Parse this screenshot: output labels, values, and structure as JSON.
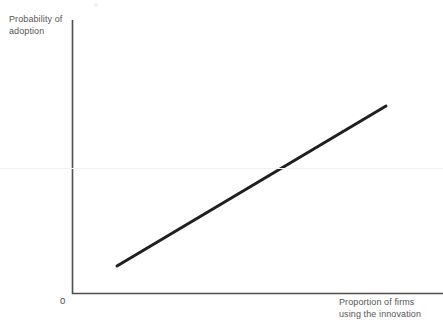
{
  "figure": {
    "background_color": "#ffffff",
    "axis_color": "#4d4d4d",
    "line_color": "#1f1f1f",
    "label_color": "#575757",
    "origin_label": "0",
    "y_axis_label": "Probability of\nadoption",
    "x_axis_label": "Proportion of firms\nusing the innovation"
  },
  "chart_data": {
    "type": "line",
    "title": "",
    "subtitle": "",
    "xlabel": "Proportion of firms using the innovation",
    "ylabel": "Probability of adoption",
    "xlim": [
      0,
      1
    ],
    "ylim": [
      0,
      1
    ],
    "grid": false,
    "legend": "none",
    "axis_ticks": {
      "x": [
        "0"
      ],
      "y": []
    },
    "annotations": [
      {
        "text": "0",
        "x": 0,
        "y": 0,
        "note": "origin tick label at axis corner"
      }
    ],
    "series": [
      {
        "name": "Probability of adoption",
        "style": "solid",
        "width_px": 3,
        "color": "#1f1f1f",
        "x": [
          0.145,
          0.31,
          0.475,
          0.64,
          0.805,
          0.97
        ],
        "y": [
          0.105,
          0.237,
          0.369,
          0.501,
          0.633,
          0.765
        ],
        "endpoints_px": {
          "start": [
            117,
            266
          ],
          "end": [
            386,
            106
          ]
        },
        "description": "Straight upward-sloping line: probability of adoption rises linearly with the proportion of firms already using the innovation."
      }
    ]
  }
}
